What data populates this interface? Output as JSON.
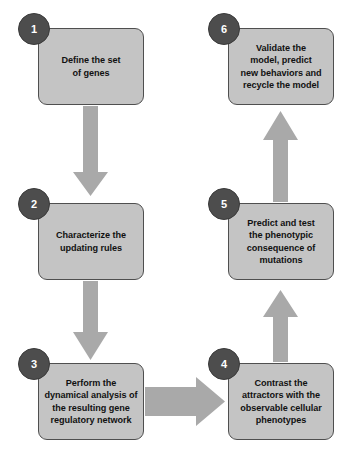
{
  "diagram": {
    "type": "flowchart",
    "colors": {
      "box_fill": "#c4c4c4",
      "box_border": "#4f4f4f",
      "badge_fill": "#4d4d4d",
      "badge_text": "#ffffff",
      "arrow_fill": "#a9a9a9",
      "text": "#111111",
      "background": "#ffffff"
    },
    "nodes": [
      {
        "id": "step-1",
        "number": "1",
        "label": "Define the set\nof genes",
        "x": 38,
        "y": 28,
        "w": 106,
        "h": 77,
        "badge_x": 18,
        "badge_y": 13
      },
      {
        "id": "step-2",
        "number": "2",
        "label": "Characterize the\nupdating rules",
        "x": 38,
        "y": 203,
        "w": 106,
        "h": 77,
        "badge_x": 18,
        "badge_y": 188
      },
      {
        "id": "step-3",
        "number": "3",
        "label": "Perform the\ndynamical analysis of\nthe resulting gene\nregulatory network",
        "x": 38,
        "y": 363,
        "w": 106,
        "h": 77,
        "badge_x": 18,
        "badge_y": 348
      },
      {
        "id": "step-4",
        "number": "4",
        "label": "Contrast the\nattractors with the\nobservable cellular\nphenotypes",
        "x": 228,
        "y": 363,
        "w": 106,
        "h": 77,
        "badge_x": 208,
        "badge_y": 348
      },
      {
        "id": "step-5",
        "number": "5",
        "label": "Predict and test\nthe phenotypic\nconsequence of\nmutations",
        "x": 228,
        "y": 203,
        "w": 106,
        "h": 77,
        "badge_x": 208,
        "badge_y": 188
      },
      {
        "id": "step-6",
        "number": "6",
        "label": "Validate the\nmodel,  predict\nnew behaviors and\nrecycle the model",
        "x": 228,
        "y": 28,
        "w": 106,
        "h": 77,
        "badge_x": 208,
        "badge_y": 13
      }
    ],
    "edges": [
      {
        "id": "edge-1-2",
        "from": "step-1",
        "to": "step-2",
        "direction": "down"
      },
      {
        "id": "edge-2-3",
        "from": "step-2",
        "to": "step-3",
        "direction": "down"
      },
      {
        "id": "edge-3-4",
        "from": "step-3",
        "to": "step-4",
        "direction": "right"
      },
      {
        "id": "edge-4-5",
        "from": "step-4",
        "to": "step-5",
        "direction": "up"
      },
      {
        "id": "edge-5-6",
        "from": "step-5",
        "to": "step-6",
        "direction": "up"
      }
    ]
  }
}
